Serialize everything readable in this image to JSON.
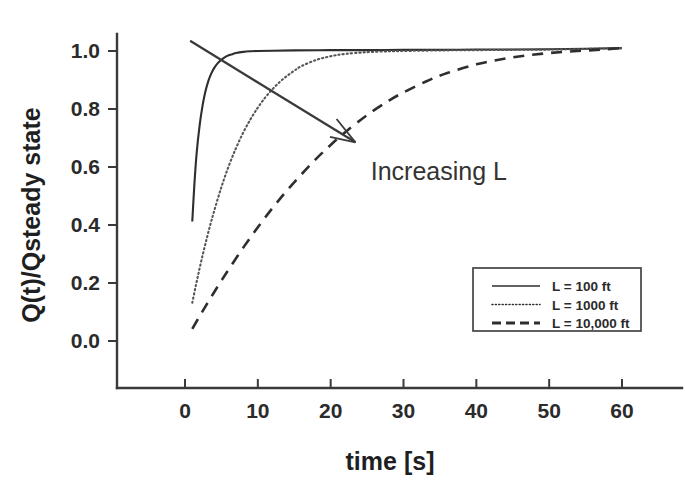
{
  "chart_data": {
    "type": "line",
    "title": "",
    "xlabel": "time [s]",
    "ylabel": "Q(t)/Qsteady state",
    "xlim": [
      0,
      65
    ],
    "ylim": [
      0.0,
      1.08
    ],
    "xticks": [
      0,
      10,
      20,
      30,
      40,
      50,
      60
    ],
    "xtick_labels": [
      "0",
      "10",
      "20",
      "30",
      "40",
      "50",
      "60"
    ],
    "yticks": [
      0.0,
      0.2,
      0.4,
      0.6,
      0.8,
      1.0
    ],
    "ytick_labels": [
      "0.0",
      "0.2",
      "0.4",
      "0.6",
      "0.8",
      "1.0"
    ],
    "grid": false,
    "legend_position": "lower right",
    "annotations": [
      {
        "text": "Increasing L",
        "x": 25.5,
        "y": 0.585,
        "arrow_from_x": 0.7,
        "arrow_from_y": 1.035,
        "arrow_to_x": 23.4,
        "arrow_to_y": 0.685
      }
    ],
    "series": [
      {
        "name": "L = 100 ft",
        "style": "solid",
        "color": "#2e2e2e",
        "x": [
          1.0,
          1.3,
          1.6,
          2.0,
          2.4,
          2.8,
          3.2,
          3.6,
          4.0,
          4.5,
          5.0,
          5.5,
          6.0,
          6.5,
          7.0,
          8.0,
          9.0,
          10.0,
          12.0,
          15.0,
          20.0,
          25.0,
          30.0,
          35.0,
          40.0,
          45.0,
          50.0,
          55.0,
          60.0
        ],
        "y": [
          0.412,
          0.545,
          0.648,
          0.742,
          0.81,
          0.86,
          0.896,
          0.922,
          0.941,
          0.958,
          0.97,
          0.979,
          0.985,
          0.989,
          0.993,
          0.997,
          0.999,
          1.0,
          1.001,
          1.002,
          1.003,
          1.003,
          1.004,
          1.004,
          1.005,
          1.005,
          1.006,
          1.008,
          1.01
        ]
      },
      {
        "name": "L = 1000 ft",
        "style": "dotted",
        "color": "#555555",
        "x": [
          1.0,
          1.5,
          2.0,
          2.5,
          3.0,
          3.5,
          4.0,
          5.0,
          6.0,
          7.0,
          8.0,
          9.0,
          10.0,
          11.0,
          12.0,
          13.0,
          14.0,
          15.0,
          16.0,
          18.0,
          20.0,
          22.0,
          25.0,
          28.0,
          30.0,
          35.0,
          40.0,
          45.0,
          50.0,
          55.0,
          60.0
        ],
        "y": [
          0.132,
          0.193,
          0.25,
          0.304,
          0.355,
          0.403,
          0.448,
          0.531,
          0.603,
          0.665,
          0.719,
          0.765,
          0.805,
          0.839,
          0.868,
          0.893,
          0.914,
          0.932,
          0.948,
          0.969,
          0.982,
          0.99,
          0.996,
          0.999,
          1.0,
          1.002,
          1.003,
          1.004,
          1.005,
          1.007,
          1.01
        ]
      },
      {
        "name": "L = 10,000 ft",
        "style": "dashed",
        "color": "#2e2e2e",
        "x": [
          1.0,
          2.0,
          3.0,
          4.0,
          5.0,
          6.0,
          8.0,
          10.0,
          12.0,
          14.0,
          16.0,
          18.0,
          20.0,
          22.0,
          25.0,
          28.0,
          30.0,
          33.0,
          36.0,
          40.0,
          44.0,
          48.0,
          52.0,
          56.0,
          60.0
        ],
        "y": [
          0.042,
          0.085,
          0.127,
          0.168,
          0.208,
          0.247,
          0.322,
          0.392,
          0.458,
          0.519,
          0.575,
          0.628,
          0.676,
          0.72,
          0.779,
          0.829,
          0.857,
          0.894,
          0.924,
          0.954,
          0.974,
          0.988,
          0.997,
          1.003,
          1.01
        ]
      }
    ]
  },
  "legend": {
    "entries": [
      {
        "label": "L = 100 ft",
        "style": "solid"
      },
      {
        "label": "L = 1000 ft",
        "style": "dotted"
      },
      {
        "label": "L = 10,000 ft",
        "style": "dashed"
      }
    ]
  }
}
